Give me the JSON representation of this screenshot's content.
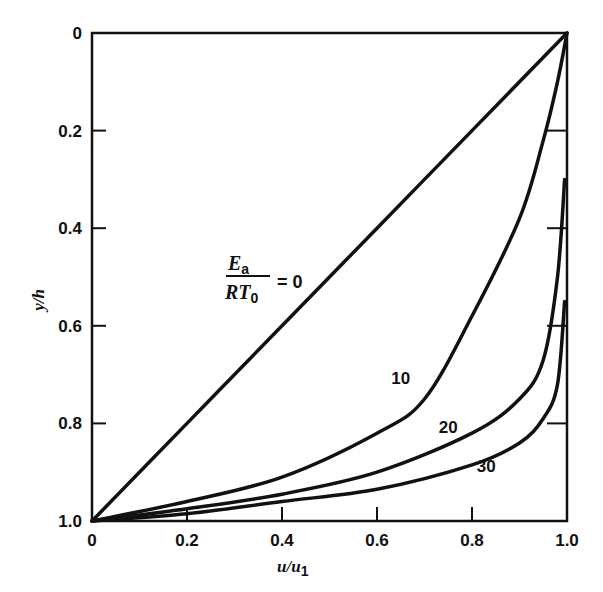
{
  "chart_data": {
    "type": "line",
    "title": "",
    "xlabel": "u/u1",
    "ylabel": "y/h",
    "xlim": [
      0,
      1.0
    ],
    "ylim": [
      0,
      1.0
    ],
    "y_inverted": true,
    "grid": false,
    "x_ticks": [
      "0",
      "0.2",
      "0.4",
      "0.6",
      "0.8",
      "1.0"
    ],
    "y_ticks": [
      "0",
      "0.2",
      "0.4",
      "0.6",
      "0.8",
      "1.0"
    ],
    "parameter_label": {
      "numerator": "E",
      "numerator_sub": "a",
      "denominator": "RT",
      "denominator_sub": "0",
      "equals": "= 0"
    },
    "series": [
      {
        "name": "Ea/RT0 = 0",
        "label": "0",
        "x": [
          0,
          0.2,
          0.4,
          0.6,
          0.8,
          1.0
        ],
        "y": [
          1.0,
          0.8,
          0.6,
          0.4,
          0.2,
          0.0
        ]
      },
      {
        "name": "Ea/RT0 = 10",
        "label": "10",
        "x": [
          0,
          0.2,
          0.4,
          0.6,
          0.7,
          0.8,
          0.9,
          0.95,
          0.98,
          1.0
        ],
        "y": [
          1.0,
          0.96,
          0.91,
          0.82,
          0.75,
          0.58,
          0.38,
          0.22,
          0.1,
          0.0
        ]
      },
      {
        "name": "Ea/RT0 = 20",
        "label": "20",
        "x": [
          0,
          0.2,
          0.4,
          0.6,
          0.8,
          0.9,
          0.95,
          0.98,
          0.995
        ],
        "y": [
          1.0,
          0.975,
          0.945,
          0.9,
          0.82,
          0.75,
          0.67,
          0.5,
          0.3
        ]
      },
      {
        "name": "Ea/RT0 = 30",
        "label": "30",
        "x": [
          0,
          0.2,
          0.4,
          0.6,
          0.8,
          0.9,
          0.95,
          0.98,
          0.995
        ],
        "y": [
          1.0,
          0.985,
          0.96,
          0.935,
          0.885,
          0.84,
          0.79,
          0.72,
          0.55
        ]
      }
    ],
    "annotations": [
      {
        "text": "10",
        "x": 0.65,
        "y": 0.72
      },
      {
        "text": "20",
        "x": 0.75,
        "y": 0.82
      },
      {
        "text": "30",
        "x": 0.83,
        "y": 0.9
      }
    ]
  },
  "axes": {
    "x_label_main": "u/u",
    "x_label_sub": "1",
    "y_label": "y/h"
  }
}
